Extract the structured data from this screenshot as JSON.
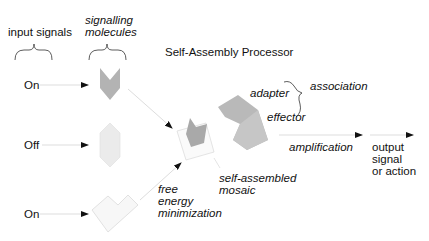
{
  "title": "Self-Assembly Processor",
  "column_headers": {
    "input_signals": "input signals",
    "signalling_molecules_line1": "signalling",
    "signalling_molecules_line2": "molecules"
  },
  "inputs": [
    {
      "label": "On",
      "molecule": "chevron-dark"
    },
    {
      "label": "Off",
      "molecule": "hexagon-light"
    },
    {
      "label": "On",
      "molecule": "v-shape-light"
    }
  ],
  "labels": {
    "adapter": "adapter",
    "effector": "effector",
    "association": "association",
    "amplification": "amplification",
    "self_assembled_line1": "self-assembled",
    "self_assembled_line2": "mosaic",
    "free_energy_line1": "free",
    "free_energy_line2": "energy",
    "free_energy_line3": "minimization",
    "output_line1": "output",
    "output_line2": "signal",
    "output_line3": "or action"
  },
  "colors": {
    "dark_shape": "#a9a9a9",
    "mid_shape": "#bdbdbd",
    "light_shape": "#e6e6e6",
    "very_light_shape": "#f3f3f3",
    "line": "#d0d0d0",
    "arrow": "#111111"
  }
}
